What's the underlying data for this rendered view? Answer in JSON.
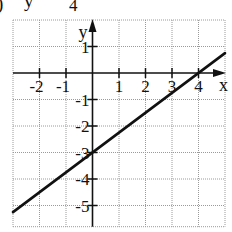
{
  "header_fragment": {
    "paren": ")",
    "var": "y",
    "denominator": "4"
  },
  "chart_data": {
    "type": "line",
    "title": "",
    "xlabel": "x",
    "ylabel": "y",
    "xlim": [
      -3,
      5
    ],
    "ylim": [
      -5.8,
      2
    ],
    "grid": true,
    "x_ticks": [
      -2,
      -1,
      1,
      2,
      3,
      4
    ],
    "y_ticks": [
      1,
      -1,
      -2,
      -3,
      -4,
      -5
    ],
    "x_tick_labels": [
      "-2",
      "-1",
      "1",
      "2",
      "3",
      "4"
    ],
    "y_tick_labels": [
      "1",
      "-1",
      "-2",
      "-3",
      "-4",
      "-5"
    ],
    "series": [
      {
        "name": "y = 3/4 x - 3",
        "slope": 0.75,
        "intercept": -3,
        "x": [
          -3,
          5
        ],
        "y": [
          -5.25,
          0.75
        ]
      }
    ],
    "colors": {
      "line": "#111111",
      "grid": "#9a9a9a",
      "axis": "#111111"
    }
  }
}
